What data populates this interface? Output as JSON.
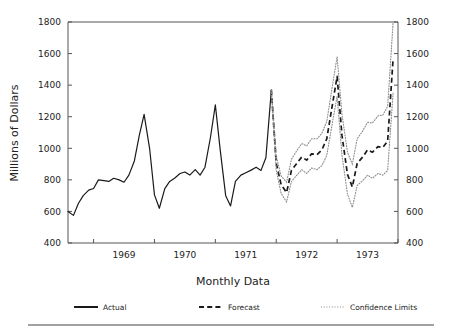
{
  "chart_data": {
    "type": "line",
    "title": "",
    "xlabel": "Monthly Data",
    "ylabel": "Millions of Dollars",
    "ylim": [
      400,
      1800
    ],
    "yticks": [
      400,
      600,
      800,
      1000,
      1200,
      1400,
      1600,
      1800
    ],
    "ytick_labels_left": [
      "400",
      "600",
      "800",
      "1000",
      "1200",
      "1400",
      "1600",
      "1800"
    ],
    "ytick_labels_right": [
      "400",
      "600",
      "800",
      "1000",
      "1200",
      "1400",
      "1600",
      "1800"
    ],
    "xtick_labels": [
      "1969",
      "1970",
      "1971",
      "1972",
      "1973"
    ],
    "x_start": 1968.58,
    "x_end": 1974.0,
    "grid": false,
    "dual_y_axis": true,
    "legend_position": "below",
    "legend": [
      {
        "name": "Actual",
        "style": "solid",
        "color": "#1a1a1a"
      },
      {
        "name": "Forecast",
        "style": "dashed",
        "color": "#1a1a1a"
      },
      {
        "name": "Confidence Limits",
        "style": "dotted",
        "color": "#8c8c8c"
      }
    ],
    "series": [
      {
        "name": "Actual",
        "style": "solid",
        "x": [
          1968.58,
          1968.67,
          1968.75,
          1968.83,
          1968.92,
          1969.0,
          1969.08,
          1969.17,
          1969.25,
          1969.33,
          1969.42,
          1969.5,
          1969.58,
          1969.67,
          1969.75,
          1969.83,
          1969.92,
          1970.0,
          1970.08,
          1970.17,
          1970.25,
          1970.33,
          1970.42,
          1970.5,
          1970.58,
          1970.67,
          1970.75,
          1970.83,
          1970.92,
          1971.0,
          1971.08,
          1971.17,
          1971.25,
          1971.33,
          1971.42,
          1971.5,
          1971.58,
          1971.67,
          1971.75,
          1971.83,
          1971.92
        ],
        "values": [
          600,
          575,
          650,
          700,
          735,
          745,
          800,
          795,
          790,
          810,
          800,
          785,
          830,
          920,
          1080,
          1215,
          1000,
          705,
          620,
          745,
          790,
          810,
          840,
          850,
          830,
          865,
          830,
          880,
          1070,
          1275,
          990,
          700,
          635,
          790,
          830,
          845,
          860,
          880,
          860,
          940,
          1370
        ]
      },
      {
        "name": "Forecast",
        "style": "dashed",
        "x": [
          1971.92,
          1972.0,
          1972.08,
          1972.17,
          1972.25,
          1972.33,
          1972.42,
          1972.5,
          1972.58,
          1972.67,
          1972.75,
          1972.83,
          1972.92,
          1973.0,
          1973.08,
          1973.17,
          1973.25,
          1973.33,
          1973.42,
          1973.5,
          1973.58,
          1973.67,
          1973.75,
          1973.83,
          1973.92
        ],
        "values": [
          1370,
          905,
          770,
          720,
          860,
          900,
          945,
          925,
          965,
          960,
          990,
          1060,
          1270,
          1455,
          1080,
          835,
          755,
          905,
          945,
          990,
          975,
          1010,
          1005,
          1045,
          1570
        ]
      },
      {
        "name": "Upper Confidence Limit",
        "style": "dotted",
        "x": [
          1971.92,
          1972.0,
          1972.08,
          1972.17,
          1972.25,
          1972.33,
          1972.42,
          1972.5,
          1972.58,
          1972.67,
          1972.75,
          1972.83,
          1972.92,
          1973.0,
          1973.08,
          1973.17,
          1973.25,
          1973.33,
          1973.42,
          1973.5,
          1973.58,
          1973.67,
          1973.75,
          1973.83,
          1973.92
        ],
        "values": [
          1370,
          950,
          825,
          785,
          930,
          980,
          1030,
          1015,
          1060,
          1060,
          1095,
          1170,
          1390,
          1580,
          1215,
          975,
          900,
          1060,
          1110,
          1165,
          1160,
          1205,
          1210,
          1265,
          1800
        ]
      },
      {
        "name": "Lower Confidence Limit",
        "style": "dotted",
        "x": [
          1971.92,
          1972.0,
          1972.08,
          1972.17,
          1972.25,
          1972.33,
          1972.42,
          1972.5,
          1972.58,
          1972.67,
          1972.75,
          1972.83,
          1972.92,
          1973.0,
          1973.08,
          1973.17,
          1973.25,
          1973.33,
          1973.42,
          1973.5,
          1973.58,
          1973.67,
          1973.75,
          1973.83,
          1973.92
        ],
        "values": [
          1370,
          860,
          715,
          660,
          790,
          825,
          865,
          840,
          875,
          865,
          890,
          955,
          1155,
          1330,
          955,
          710,
          625,
          765,
          795,
          830,
          810,
          840,
          830,
          860,
          1355
        ]
      }
    ]
  },
  "footer": {
    "rule": true
  }
}
